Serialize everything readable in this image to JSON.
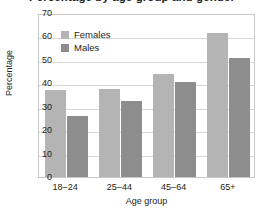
{
  "chart_data": {
    "type": "bar",
    "title": "Percentage by age group and gender",
    "xlabel": "Age group",
    "ylabel": "Percentage",
    "categories": [
      "18–24",
      "25–44",
      "45–64",
      "65+"
    ],
    "series": [
      {
        "name": "Females",
        "color": "#b4b4b4",
        "values": [
          37,
          37.5,
          44,
          61.5
        ]
      },
      {
        "name": "Males",
        "color": "#8d8d8d",
        "values": [
          26,
          32.5,
          40.5,
          51
        ]
      }
    ],
    "ylim": [
      0,
      70
    ],
    "yticks": [
      0,
      10,
      20,
      30,
      40,
      50,
      60,
      70
    ],
    "ytick_labels": [
      "0",
      "10",
      "20",
      "30",
      "40",
      "50",
      "60",
      "70"
    ],
    "grid": true,
    "legend_position": "upper left",
    "orientation": "vertical",
    "grouping": "grouped"
  }
}
